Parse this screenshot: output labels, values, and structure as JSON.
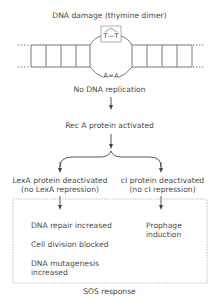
{
  "title": "DNA damage (thymine dimer)",
  "dna": {
    "dimer_label": "T—T",
    "pair_label": "A=A"
  },
  "steps": {
    "no_replication": "No DNA replication",
    "reca": "Rec A protein activated"
  },
  "branches": {
    "left": {
      "line1": "LexA protein deactivated",
      "line2": "(no LexA repression)"
    },
    "right": {
      "line1": "cI protein deactivated",
      "line2": "(no cI repression)"
    }
  },
  "sos": {
    "label": "SOS response",
    "left_items": [
      "DNA repair increased",
      "Cell division blocked",
      "DNA mutagenesis",
      "increased"
    ],
    "right_items": [
      "Prophage",
      "induction"
    ]
  },
  "colors": {
    "line": "#666666",
    "text": "#4a4a4a",
    "dotted": "#9a9a9a"
  }
}
